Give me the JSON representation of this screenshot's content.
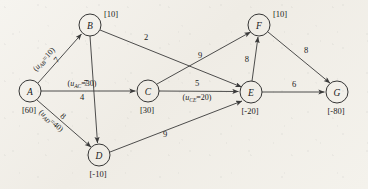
{
  "figure": {
    "type": "network-flow-graph",
    "title": ""
  },
  "nodes": [
    {
      "id": "A",
      "label": "A",
      "bracket": "[60]",
      "cx": 30,
      "cy": 91,
      "r": 11
    },
    {
      "id": "B",
      "label": "B",
      "bracket": "[10]",
      "cx": 90,
      "cy": 25,
      "r": 11
    },
    {
      "id": "C",
      "label": "C",
      "bracket": "[30]",
      "cx": 148,
      "cy": 91,
      "r": 11
    },
    {
      "id": "D",
      "label": "D",
      "bracket": "[-10]",
      "cx": 99,
      "cy": 155,
      "r": 11
    },
    {
      "id": "E",
      "label": "E",
      "bracket": "[-20]",
      "cx": 251,
      "cy": 92,
      "r": 11
    },
    {
      "id": "F",
      "label": "F",
      "bracket": "[10]",
      "cx": 259,
      "cy": 25,
      "r": 11
    },
    {
      "id": "G",
      "label": "G",
      "bracket": "[-80]",
      "cx": 337,
      "cy": 92,
      "r": 11
    }
  ],
  "edges": [
    {
      "id": "AB",
      "from": "A",
      "to": "B",
      "cost": "7",
      "capacity": "(u_AB=10)",
      "cap_head": "u",
      "cap_sub": "AB",
      "cap_tail": "=10)"
    },
    {
      "id": "AC",
      "from": "A",
      "to": "C",
      "cost": "4",
      "capacity": "(u_AC=30)",
      "cap_head": "u",
      "cap_sub": "AC",
      "cap_tail": "=30)"
    },
    {
      "id": "AD",
      "from": "A",
      "to": "D",
      "cost": "8",
      "capacity": "(u_AD=40)",
      "cap_head": "u",
      "cap_sub": "AD",
      "cap_tail": "=40)"
    },
    {
      "id": "BD",
      "from": "B",
      "to": "D",
      "cost": "7",
      "capacity": ""
    },
    {
      "id": "BE",
      "from": "B",
      "to": "E",
      "cost": "2",
      "capacity": ""
    },
    {
      "id": "CF",
      "from": "C",
      "to": "F",
      "cost": "9",
      "capacity": ""
    },
    {
      "id": "CE",
      "from": "C",
      "to": "E",
      "cost": "5",
      "capacity": "(u_CE=20)",
      "cap_head": "u",
      "cap_sub": "CE",
      "cap_tail": "=20)"
    },
    {
      "id": "DE",
      "from": "D",
      "to": "E",
      "cost": "9",
      "capacity": ""
    },
    {
      "id": "EF",
      "from": "E",
      "to": "F",
      "cost": "8",
      "capacity": ""
    },
    {
      "id": "FG",
      "from": "F",
      "to": "G",
      "cost": "8",
      "capacity": ""
    },
    {
      "id": "EG",
      "from": "E",
      "to": "G",
      "cost": "6",
      "capacity": ""
    }
  ],
  "labels": {
    "node_A": "A",
    "node_B": "B",
    "node_C": "C",
    "node_D": "D",
    "node_E": "E",
    "node_F": "F",
    "node_G": "G",
    "brk_A": "[60]",
    "brk_B": "[10]",
    "brk_C": "[30]",
    "brk_D": "[-10]",
    "brk_E": "[-20]",
    "brk_F": "[10]",
    "brk_G": "[-80]",
    "cost_AB": "7",
    "cost_AC": "4",
    "cost_AD": "8",
    "cost_BD": "7",
    "cost_BE": "2",
    "cost_CF": "9",
    "cost_CE": "5",
    "cost_DE": "9",
    "cost_EF": "8",
    "cost_FG": "8",
    "cost_EG": "6",
    "cap_AB_open": "(",
    "cap_AB_u": "u",
    "cap_AB_sub": "AB",
    "cap_AB_val": "=10)",
    "cap_AC_open": "(",
    "cap_AC_u": "u",
    "cap_AC_sub": "AC",
    "cap_AC_val": "=30)",
    "cap_AD_open": "(",
    "cap_AD_u": "u",
    "cap_AD_sub": "AD",
    "cap_AD_val": "=40)",
    "cap_CE_open": "(",
    "cap_CE_u": "u",
    "cap_CE_sub": "CE",
    "cap_CE_val": "=20)"
  },
  "colors": {
    "background": "#f3f1ec",
    "stroke": "#3a3a3a",
    "text": "#1a1a1a"
  }
}
